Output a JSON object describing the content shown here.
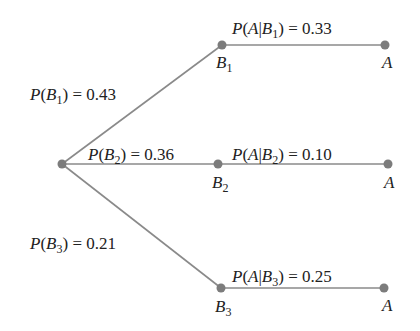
{
  "diagram": {
    "type": "probability-tree",
    "colors": {
      "edge": "#8a8a8a",
      "node": "#7c7c7c",
      "text": "#222222"
    },
    "root": {
      "x": 62,
      "y": 164
    },
    "branches": [
      {
        "node_label": "B",
        "node_sub": "1",
        "prob_label": "P(B1) = 0.43",
        "prob_value": "0.43",
        "cond_label": "P(A|B1) = 0.33",
        "cond_value": "0.33",
        "outcome_label": "A",
        "node": {
          "x": 222,
          "y": 45
        },
        "leaf": {
          "x": 385,
          "y": 45
        }
      },
      {
        "node_label": "B",
        "node_sub": "2",
        "prob_label": "P(B2) = 0.36",
        "prob_value": "0.36",
        "cond_label": "P(A|B2) = 0.10",
        "cond_value": "0.10",
        "outcome_label": "A",
        "node": {
          "x": 218,
          "y": 164
        },
        "leaf": {
          "x": 388,
          "y": 164
        }
      },
      {
        "node_label": "B",
        "node_sub": "3",
        "prob_label": "P(B3) = 0.21",
        "prob_value": "0.21",
        "cond_label": "P(A|B3) = 0.25",
        "cond_value": "0.25",
        "outcome_label": "A",
        "node": {
          "x": 221,
          "y": 288
        },
        "leaf": {
          "x": 384,
          "y": 288
        }
      }
    ]
  },
  "text": {
    "P": "P",
    "eq": " = ",
    "A": "A",
    "B": "B",
    "bar": "|",
    "lp": "(",
    "rp": ")",
    "s1": "1",
    "s2": "2",
    "s3": "3",
    "v_b1": "0.43",
    "v_b2": "0.36",
    "v_b3": "0.21",
    "v_a1": "0.33",
    "v_a2": "0.10",
    "v_a3": "0.25"
  }
}
